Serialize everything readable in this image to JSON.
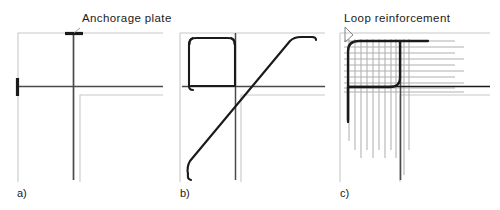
{
  "figure": {
    "type": "engineering-detail-drawing",
    "background_color": "#ffffff",
    "width": 500,
    "height": 210,
    "colors": {
      "concrete_outline": "#c8c8c8",
      "reinforcement_bar": "#1a1a1a",
      "tendon": "#4a4a4a",
      "secondary_bar": "#b4b4b4",
      "leader_line": "#555555",
      "text": "#1a1a1a"
    }
  },
  "annotations": {
    "anchorage_plate_label": "Anchorage plate",
    "loop_reinforcement_label": "Loop reinforcement"
  },
  "panels": [
    {
      "id": "a",
      "label": "a)",
      "caption_label": "Anchorage plate",
      "description": "Corner with two post-tensioning tendons crossing at the corner, each terminated by an anchorage plate at the free end",
      "elements": [
        "vertical-tendon",
        "horizontal-tendon",
        "top-anchorage-plate",
        "left-anchorage-plate",
        "concrete-outline"
      ]
    },
    {
      "id": "b",
      "label": "b)",
      "caption_label": "",
      "description": "Corner with a closed rounded-rectangular loop bar plus an inclined diagonal bar with hooked ends",
      "elements": [
        "rounded-loop-bar",
        "diagonal-bar",
        "horizontal-bar",
        "vertical-bar",
        "concrete-outline"
      ]
    },
    {
      "id": "c",
      "label": "c)",
      "caption_label": "Loop reinforcement",
      "description": "Corner with dense orthogonal loop reinforcement mesh overlaid by a heavy rounded corner loop",
      "elements": [
        "loop-reinforcement-mesh",
        "rounded-loop-bar",
        "horizontal-bar",
        "vertical-bar",
        "concrete-outline"
      ],
      "mesh": {
        "vertical_bar_count": 11,
        "horizontal_bar_count": 11
      }
    }
  ]
}
